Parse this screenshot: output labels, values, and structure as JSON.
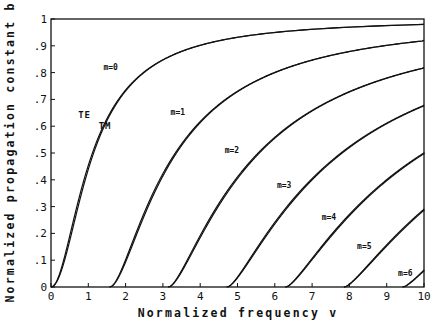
{
  "chart_data": {
    "type": "line",
    "title": "",
    "xlabel": "Normalized frequency v",
    "ylabel": "Normalized propagation constant b",
    "xlim": [
      0,
      10
    ],
    "ylim": [
      0,
      1
    ],
    "grid": false,
    "legend": "inline labels",
    "x_ticks": [
      "0",
      "1",
      "2",
      "3",
      "4",
      "5",
      "6",
      "7",
      "8",
      "9",
      "10"
    ],
    "y_ticks": [
      "0",
      ".1",
      ".2",
      ".3",
      ".4",
      ".5",
      ".6",
      ".7",
      ".8",
      ".9",
      "1"
    ],
    "annotations": [
      {
        "text": "TE",
        "x": 0.9,
        "y": 0.63
      },
      {
        "text": "TM",
        "x": 1.45,
        "y": 0.59
      },
      {
        "text": "m=0",
        "x": 1.6,
        "y": 0.81
      },
      {
        "text": "m=1",
        "x": 3.4,
        "y": 0.64
      },
      {
        "text": "m=2",
        "x": 4.85,
        "y": 0.5
      },
      {
        "text": "m=3",
        "x": 6.25,
        "y": 0.37
      },
      {
        "text": "m=4",
        "x": 7.45,
        "y": 0.25
      },
      {
        "text": "m=5",
        "x": 8.4,
        "y": 0.14
      },
      {
        "text": "m=6",
        "x": 9.5,
        "y": 0.04
      }
    ],
    "series": [
      {
        "name": "m=0 TE",
        "cutoff": 0,
        "x": [
          0,
          1,
          2,
          3,
          4,
          5,
          6,
          8,
          10
        ],
        "values": [
          0,
          0.45,
          0.735,
          0.85,
          0.905,
          0.932,
          0.95,
          0.969,
          0.98
        ]
      },
      {
        "name": "m=1 TE",
        "cutoff": 1.571,
        "x": [
          1.571,
          2,
          3,
          4,
          5,
          6,
          8,
          10
        ],
        "values": [
          0,
          0.11,
          0.42,
          0.618,
          0.73,
          0.8,
          0.88,
          0.92
        ]
      },
      {
        "name": "m=2 TE",
        "cutoff": 3.142,
        "x": [
          3.142,
          4,
          5,
          6,
          7,
          8,
          9,
          10
        ],
        "values": [
          0,
          0.2,
          0.42,
          0.56,
          0.66,
          0.72,
          0.77,
          0.81
        ]
      },
      {
        "name": "m=3 TE",
        "cutoff": 4.712,
        "x": [
          4.712,
          5,
          6,
          7,
          8,
          9,
          10
        ],
        "values": [
          0,
          0.03,
          0.23,
          0.38,
          0.49,
          0.58,
          0.66
        ]
      },
      {
        "name": "m=4 TE",
        "cutoff": 6.283,
        "x": [
          6.283,
          7,
          8,
          9,
          10
        ],
        "values": [
          0,
          0.09,
          0.26,
          0.38,
          0.49
        ]
      },
      {
        "name": "m=5 TE",
        "cutoff": 7.854,
        "x": [
          7.854,
          8,
          9,
          10
        ],
        "values": [
          0,
          0.01,
          0.15,
          0.28
        ]
      },
      {
        "name": "m=6 TE",
        "cutoff": 9.425,
        "x": [
          9.425,
          10
        ],
        "values": [
          0,
          0.05
        ]
      }
    ],
    "note": "Each mode drawn as a TE/TM pair of closely spaced lines; TM slightly below TE."
  },
  "plot": {
    "left": 51,
    "right": 424,
    "top": 19,
    "bottom": 287,
    "modes": [
      0,
      1,
      2,
      3,
      4,
      5,
      6
    ]
  }
}
